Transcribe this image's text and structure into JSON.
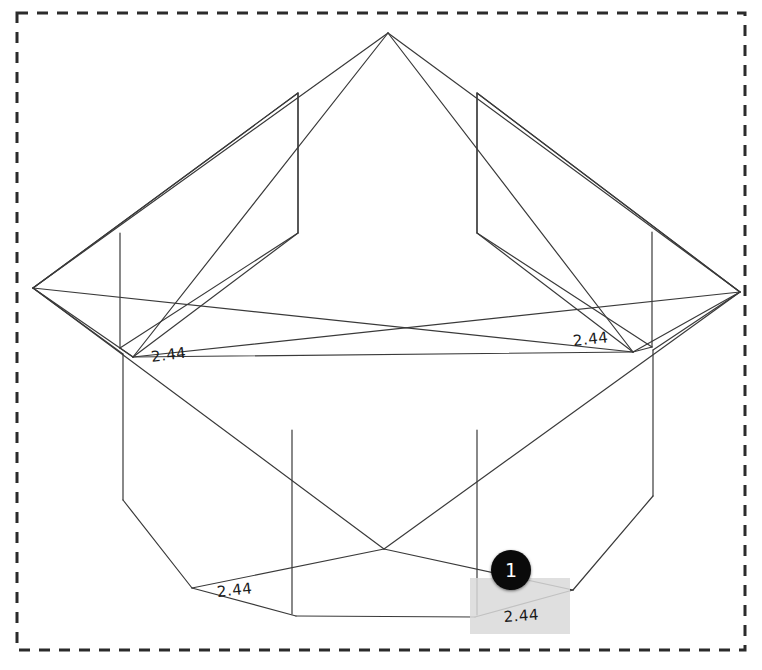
{
  "viewport": {
    "width": 762,
    "height": 670,
    "background_color": "#ffffff",
    "name": "model-viewport"
  },
  "selection_border": {
    "style": "dashed",
    "color": "#2b2b2b",
    "x": 17,
    "y": 13,
    "width": 728,
    "height": 637,
    "dash": "11 9",
    "stroke_width": 3
  },
  "model": {
    "line_color": "#3a3a3a",
    "stroke_width": 1.2,
    "description": "wireframe-hip-roof-structure",
    "vertices": {
      "apex": [
        388,
        33
      ],
      "left": [
        33,
        288
      ],
      "right": [
        740,
        292
      ],
      "cross": [
        384,
        549
      ],
      "ul_eave": [
        133,
        357
      ],
      "ur_eave": [
        633,
        352
      ],
      "ll_eave": [
        192,
        588
      ],
      "lr_eave": [
        573,
        590
      ],
      "ll_low": [
        296,
        616
      ],
      "lr_low": [
        475,
        617
      ],
      "ul_top": [
        298,
        93
      ],
      "ur_top": [
        477,
        93
      ],
      "ul_bot": [
        298,
        233
      ],
      "ur_bot": [
        477,
        233
      ],
      "ltop_v_top": [
        120,
        233
      ],
      "ltop_v_bot": [
        120,
        348
      ],
      "rtop_v_top": [
        652,
        232
      ],
      "rtop_v_bot": [
        652,
        347
      ],
      "lbot_v_top": [
        123,
        354
      ],
      "lbot_v_bot": [
        123,
        500
      ],
      "rbot_v_top": [
        653,
        350
      ],
      "rbot_v_bot": [
        653,
        496
      ],
      "lmid_v_top": [
        292,
        430
      ],
      "lmid_v_bot": [
        292,
        614
      ],
      "rmid_v_top": [
        477,
        430
      ],
      "rmid_v_bot": [
        477,
        615
      ]
    }
  },
  "dimensions": [
    {
      "id": "dim-left-upper",
      "value": "2.44",
      "x": 150,
      "y": 348,
      "rotation": -7
    },
    {
      "id": "dim-right-upper",
      "value": "2.44",
      "x": 572,
      "y": 332,
      "rotation": -6
    },
    {
      "id": "dim-left-lower",
      "value": "2.44",
      "x": 216,
      "y": 583,
      "rotation": -6
    },
    {
      "id": "dim-right-lower",
      "value": "2.44",
      "x": 503,
      "y": 608,
      "rotation": -4
    }
  ],
  "annotation": {
    "marker": {
      "label": "1",
      "x": 491,
      "y": 550,
      "size": 40,
      "fill_color": "#0a0a0a",
      "text_color": "#ffffff"
    },
    "highlight": {
      "x": 470,
      "y": 578,
      "width": 100,
      "height": 56,
      "color": "#d9d9d9"
    }
  }
}
